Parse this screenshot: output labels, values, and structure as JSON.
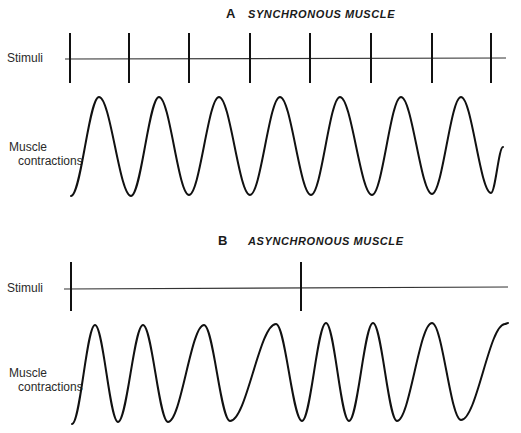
{
  "panels": [
    {
      "letter": "A",
      "title": "SYNCHRONOUS MUSCLE",
      "stimuli_label": "Stimuli",
      "contraction_label_line1": "Muscle",
      "contraction_label_line2": "contractions",
      "stimuli_x": [
        70,
        129,
        189,
        250,
        310,
        371,
        432,
        491
      ],
      "wave_points": [
        [
          71,
          196
        ],
        [
          99,
          97
        ],
        [
          131,
          196
        ],
        [
          159,
          97
        ],
        [
          189,
          195
        ],
        [
          219,
          97
        ],
        [
          250,
          195
        ],
        [
          280,
          97
        ],
        [
          311,
          195
        ],
        [
          340,
          97
        ],
        [
          372,
          195
        ],
        [
          401,
          97
        ],
        [
          432,
          194
        ],
        [
          461,
          97
        ],
        [
          491,
          193
        ],
        [
          503,
          147
        ]
      ]
    },
    {
      "letter": "B",
      "title": "ASYNCHRONOUS MUSCLE",
      "stimuli_label": "Stimuli",
      "contraction_label_line1": "Muscle",
      "contraction_label_line2": "contractions",
      "stimuli_x": [
        71,
        301
      ],
      "wave_points": [
        [
          72,
          424
        ],
        [
          95,
          325
        ],
        [
          118,
          422
        ],
        [
          143,
          325
        ],
        [
          168,
          422
        ],
        [
          204,
          325
        ],
        [
          230,
          421
        ],
        [
          276,
          324
        ],
        [
          302,
          421
        ],
        [
          326,
          323
        ],
        [
          349,
          421
        ],
        [
          373,
          323
        ],
        [
          397,
          421
        ],
        [
          432,
          323
        ],
        [
          461,
          420
        ],
        [
          505,
          324
        ],
        [
          508,
          323
        ]
      ]
    }
  ]
}
